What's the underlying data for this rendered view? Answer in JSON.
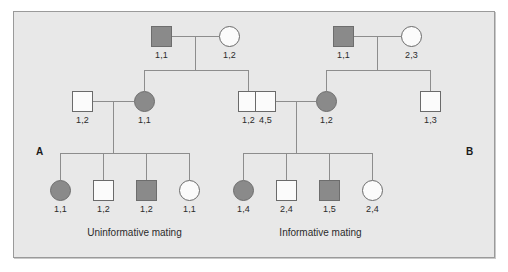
{
  "figure": {
    "background_color": "#e8e8e8",
    "border_color": "#9a9a9a",
    "symbol_filled_color": "#8a8a8a",
    "symbol_open_color": "#fbfbfb",
    "line_color": "#8d8d8d"
  },
  "panels": [
    {
      "letter": "A",
      "caption": "Uninformative mating",
      "generation1": {
        "father": {
          "shape": "square",
          "fill": "filled",
          "genotype": "1,1"
        },
        "mother": {
          "shape": "circle",
          "fill": "open",
          "genotype": "1,2"
        }
      },
      "generation2": {
        "spouse_left": {
          "shape": "square",
          "fill": "open",
          "genotype": "1,2"
        },
        "proband": {
          "shape": "circle",
          "fill": "filled",
          "genotype": "1,1"
        },
        "sibling": {
          "shape": "square",
          "fill": "open",
          "genotype": "1,2"
        }
      },
      "generation3": [
        {
          "shape": "circle",
          "fill": "filled",
          "genotype": "1,1"
        },
        {
          "shape": "square",
          "fill": "open",
          "genotype": "1,2"
        },
        {
          "shape": "square",
          "fill": "filled",
          "genotype": "1,2"
        },
        {
          "shape": "circle",
          "fill": "open",
          "genotype": "1,1"
        }
      ]
    },
    {
      "letter": "B",
      "caption": "Informative mating",
      "generation1": {
        "father": {
          "shape": "square",
          "fill": "filled",
          "genotype": "1,1"
        },
        "mother": {
          "shape": "circle",
          "fill": "open",
          "genotype": "2,3"
        }
      },
      "generation2": {
        "spouse_left": {
          "shape": "square",
          "fill": "open",
          "genotype": "4,5"
        },
        "proband": {
          "shape": "circle",
          "fill": "filled",
          "genotype": "1,2"
        },
        "sibling": {
          "shape": "square",
          "fill": "open",
          "genotype": "1,3"
        }
      },
      "generation3": [
        {
          "shape": "circle",
          "fill": "filled",
          "genotype": "1,4"
        },
        {
          "shape": "square",
          "fill": "open",
          "genotype": "2,4"
        },
        {
          "shape": "square",
          "fill": "filled",
          "genotype": "1,5"
        },
        {
          "shape": "circle",
          "fill": "open",
          "genotype": "2,4"
        }
      ]
    }
  ]
}
